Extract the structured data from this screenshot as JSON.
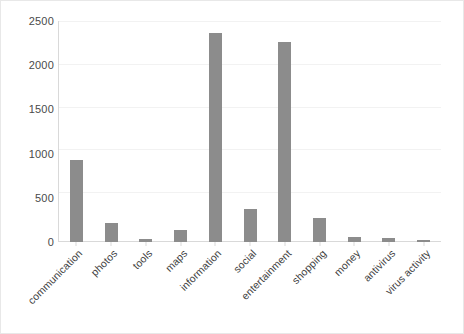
{
  "chart_data": {
    "type": "bar",
    "title": "",
    "subtitle": "",
    "xlabel": "",
    "ylabel": "",
    "ylim": [
      0,
      2500
    ],
    "yticks": [
      0,
      500,
      1000,
      1500,
      2000,
      2500
    ],
    "ytick_labels": [
      "0",
      "500",
      "1000",
      "1500",
      "2000",
      "2500"
    ],
    "grid": true,
    "legend": null,
    "legend_position": "none",
    "bar_color": "#8c8c8c",
    "categories": [
      "communication",
      "photos",
      "tools",
      "maps",
      "information",
      "social",
      "entertainment",
      "shopping",
      "money",
      "antivirus",
      "virus activity"
    ],
    "values": [
      930,
      210,
      35,
      140,
      2365,
      375,
      2265,
      270,
      60,
      50,
      20
    ],
    "series": [
      {
        "name": "count",
        "values": [
          930,
          210,
          35,
          140,
          2365,
          375,
          2265,
          270,
          60,
          50,
          20
        ]
      }
    ]
  },
  "colors": {
    "bar": "#8c8c8c",
    "axis": "#d9d9d9",
    "grid": "#f2f2f2",
    "text": "#3f3f3f",
    "background": "#ffffff",
    "frame": "#e8e8e8"
  }
}
